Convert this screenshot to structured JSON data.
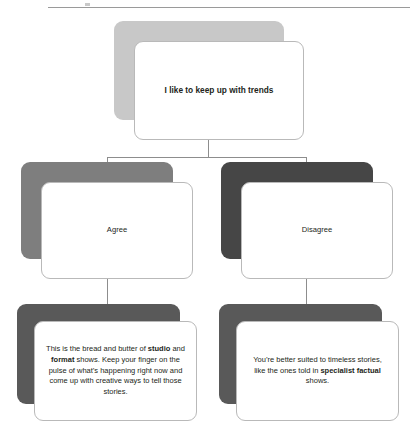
{
  "diagram": {
    "type": "decision-tree-flowchart",
    "top_rule_visible": true,
    "colors": {
      "card_background": "#ffffff",
      "card_border": "#b9b9b9",
      "connector_line": "#8d8d8d",
      "text": "#231f20",
      "shadow_root": "#c8c8c8",
      "shadow_agree": "#7e7e7e",
      "shadow_disagree": "#464646",
      "shadow_outcome": "#595959"
    },
    "root": {
      "label": "I like to keep up with trends"
    },
    "branches": [
      {
        "id": "agree",
        "label": "Agree",
        "outcome": {
          "segments": [
            {
              "text": "This is the bread and butter of ",
              "bold": false
            },
            {
              "text": "studio",
              "bold": true
            },
            {
              "text": " and ",
              "bold": false
            },
            {
              "text": "format",
              "bold": true
            },
            {
              "text": " shows. Keep your finger on the pulse of what’s happening right now and come up with creative ways to tell those stories.",
              "bold": false
            }
          ]
        }
      },
      {
        "id": "disagree",
        "label": "Disagree",
        "outcome": {
          "segments": [
            {
              "text": "You’re better suited to timeless stories, like the ones told in ",
              "bold": false
            },
            {
              "text": "specialist factual",
              "bold": true
            },
            {
              "text": " shows.",
              "bold": false
            }
          ]
        }
      }
    ]
  }
}
